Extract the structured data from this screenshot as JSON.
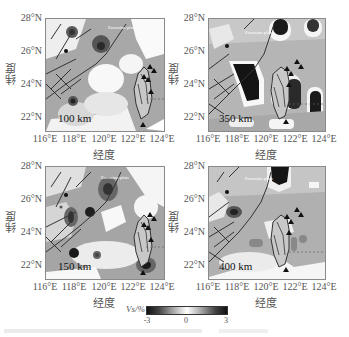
{
  "figure": {
    "panels": [
      {
        "id": "p100",
        "depth_label": "100 km",
        "plate_label": "Eurasian plate"
      },
      {
        "id": "p350",
        "depth_label": "350 km",
        "plate_label": "Eurasian plate"
      },
      {
        "id": "p150",
        "depth_label": "150 km",
        "plate_label": "Eurasian plate"
      },
      {
        "id": "p400",
        "depth_label": "400 km",
        "plate_label": "Eurasian plate"
      }
    ],
    "y_ticks": [
      "28°N",
      "26°N",
      "24°N",
      "22°N"
    ],
    "x_ticks": [
      "116°E",
      "118°E",
      "120°E",
      "122°E",
      "124°E"
    ],
    "x_axis_label": "经度",
    "y_axis_label": "纬度",
    "colorbar": {
      "label": "Vs/%",
      "ticks": [
        "-3",
        "0",
        "3"
      ],
      "min": -3,
      "max": 3,
      "colors": {
        "negative": "#1a1a1a",
        "zero": "#ffffff",
        "positive": "#1a1a1a"
      }
    },
    "caption": ""
  }
}
